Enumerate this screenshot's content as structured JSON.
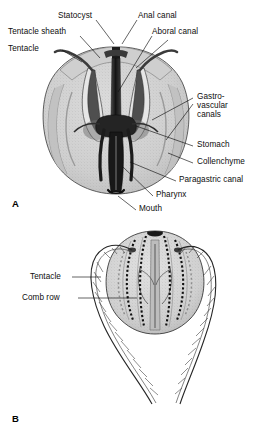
{
  "figure": {
    "background_color": "#ffffff",
    "line_color": "#1a1a1a",
    "body_fill": "#d2d2d2",
    "mesoglea_fill": "#c8c8c8",
    "canal_dark": "#2b2b2b"
  },
  "panels": [
    {
      "id": "A",
      "letter": "A",
      "view": "cutaway longitudinal section",
      "letter_x": 12,
      "letter_y": 205
    },
    {
      "id": "B",
      "letter": "B",
      "view": "whole animal with extended tentacles",
      "letter_x": 12,
      "letter_y": 420
    }
  ],
  "panel_a": {
    "labels": [
      {
        "name": "statocyst",
        "text": "Statocyst",
        "x": 58,
        "y": 16,
        "align": "left"
      },
      {
        "name": "anal-canal",
        "text": "Anal canal",
        "x": 138,
        "y": 16,
        "align": "left"
      },
      {
        "name": "tentacle-sheath",
        "text": "Tentacle sheath",
        "x": 10,
        "y": 32,
        "align": "left"
      },
      {
        "name": "aboral-canal",
        "text": "Aboral canal",
        "x": 152,
        "y": 32,
        "align": "left"
      },
      {
        "name": "tentacle",
        "text": "Tentacle",
        "x": 10,
        "y": 49,
        "align": "left"
      },
      {
        "name": "gastrovascular-canals",
        "text": "Gastro-\nvascular\ncanals",
        "x": 196,
        "y": 98,
        "align": "left"
      },
      {
        "name": "stomach",
        "text": "Stomach",
        "x": 196,
        "y": 145,
        "align": "left"
      },
      {
        "name": "collenchyme",
        "text": "Collenchyme",
        "x": 196,
        "y": 162,
        "align": "left"
      },
      {
        "name": "paragastric-canal",
        "text": "Paragastric canal",
        "x": 178,
        "y": 180,
        "align": "left"
      },
      {
        "name": "pharynx",
        "text": "Pharynx",
        "x": 155,
        "y": 195,
        "align": "left"
      },
      {
        "name": "mouth",
        "text": "Mouth",
        "x": 138,
        "y": 209,
        "align": "left"
      }
    ]
  },
  "panel_b": {
    "labels": [
      {
        "name": "tentacle",
        "text": "Tentacle",
        "x": 30,
        "y": 276,
        "align": "left"
      },
      {
        "name": "comb-row",
        "text": "Comb row",
        "x": 22,
        "y": 297,
        "align": "left"
      }
    ]
  },
  "structures": {
    "panel_a": [
      "statocyst",
      "anal canal",
      "aboral canal",
      "tentacle sheath",
      "tentacle",
      "gastrovascular canals",
      "stomach",
      "collenchyme",
      "paragastric canal",
      "pharynx",
      "mouth"
    ],
    "panel_b": [
      "tentacle",
      "comb row"
    ]
  }
}
